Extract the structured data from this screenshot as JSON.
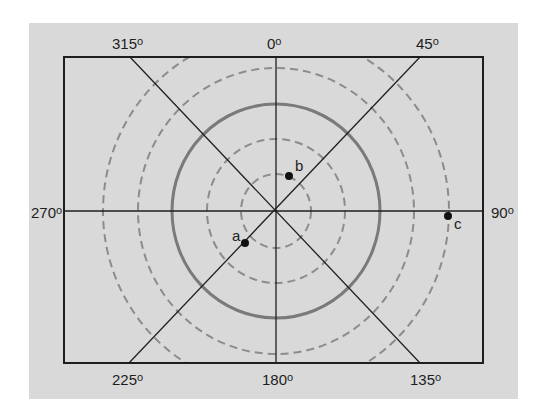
{
  "figure": {
    "background_color": "#d9d9d9",
    "frame_color": "#1e1e1e",
    "solid_circle_color": "#7a7a7a",
    "dashed_circle_color": "#8c8c8c"
  },
  "azimuth_labels": {
    "deg_0": "0",
    "deg_45": "45",
    "deg_90": "90",
    "deg_135": "135",
    "deg_180": "180",
    "deg_225": "225",
    "deg_270": "270",
    "deg_315": "315",
    "degree_symbol": "o"
  },
  "circles": [
    {
      "radius_rel": 1,
      "style": "dashed"
    },
    {
      "radius_rel": 2,
      "style": "dashed"
    },
    {
      "radius_rel": 3,
      "style": "solid"
    },
    {
      "radius_rel": 4,
      "style": "dashed"
    },
    {
      "radius_rel": 5,
      "style": "dashed"
    }
  ],
  "points": {
    "a": {
      "label": "a"
    },
    "b": {
      "label": "b"
    },
    "c": {
      "label": "c"
    }
  }
}
